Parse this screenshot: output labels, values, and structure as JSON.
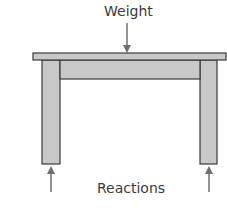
{
  "diagram": {
    "type": "free-body diagram of a table",
    "labels": {
      "top": "Weight",
      "bottom": "Reactions"
    },
    "colors": {
      "fill": "#c8c8c8",
      "stroke": "#3a3a3a",
      "arrow": "#6e6e6e",
      "text": "#3a3a3a"
    },
    "forces": [
      {
        "name": "weight",
        "direction": "down",
        "applied_to": "tabletop center"
      },
      {
        "name": "left reaction",
        "direction": "up",
        "applied_to": "left leg base"
      },
      {
        "name": "right reaction",
        "direction": "up",
        "applied_to": "right leg base"
      }
    ]
  }
}
